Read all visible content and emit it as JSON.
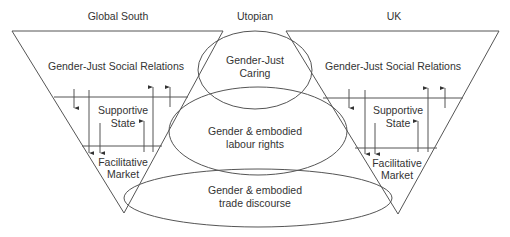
{
  "headings": {
    "left": "Global South",
    "center": "Utopian",
    "right": "UK"
  },
  "left_funnel": {
    "top_layer": "Gender-Just Social Relations",
    "middle_layer": [
      "Supportive",
      "State"
    ],
    "bottom_layer": [
      "Facilitative",
      "Market"
    ]
  },
  "right_funnel": {
    "top_layer": "Gender-Just Social Relations",
    "middle_layer": [
      "Supportive",
      "State"
    ],
    "bottom_layer": [
      "Facilitative",
      "Market"
    ]
  },
  "ellipses": {
    "top": [
      "Gender-Just",
      "Caring"
    ],
    "middle": [
      "Gender & embodied",
      "labour rights"
    ],
    "bottom": [
      "Gender & embodied",
      "trade discourse"
    ]
  },
  "colors": {
    "line": "#555555",
    "text": "#333333",
    "background": "#ffffff"
  }
}
